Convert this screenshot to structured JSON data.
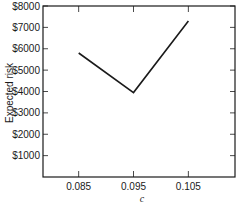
{
  "chart_data": {
    "type": "line",
    "title": "",
    "xlabel": "c",
    "ylabel": "Expected risk",
    "x": [
      0.085,
      0.095,
      0.105
    ],
    "x_tick_labels": [
      "0.085",
      "0.095",
      "0.105"
    ],
    "series": [
      {
        "name": "Expected risk",
        "values": [
          5800,
          3950,
          7300
        ]
      }
    ],
    "y_tick_labels": [
      "$1000",
      "$2000",
      "$3000",
      "$4000",
      "$5000",
      "$6000",
      "$7000",
      "$8000"
    ],
    "y_ticks": [
      1000,
      2000,
      3000,
      4000,
      5000,
      6000,
      7000,
      8000
    ],
    "ylim": [
      0,
      8000
    ],
    "xlim": [
      0.0785,
      0.1135
    ],
    "grid": false,
    "legend": "none",
    "line_color": "#1a1a1a"
  }
}
